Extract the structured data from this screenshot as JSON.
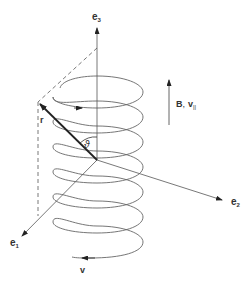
{
  "figure": {
    "type": "diagram",
    "colors": {
      "background": "#ffffff",
      "line": "#555555",
      "helix": "#666666",
      "vector": "#222222",
      "text": "#333333"
    }
  },
  "axes": {
    "e1": {
      "label": "e",
      "subscript": "1"
    },
    "e2": {
      "label": "e",
      "subscript": "2"
    },
    "e3": {
      "label": "e",
      "subscript": "3"
    }
  },
  "vectors": {
    "r": {
      "label": "r"
    },
    "v": {
      "label": "v"
    }
  },
  "angle": {
    "label": "ϑ"
  },
  "field_indicator": {
    "label_b": "B",
    "separator": ",",
    "label_v": "v",
    "subscript": "||"
  },
  "helix": {
    "turns": 6
  }
}
